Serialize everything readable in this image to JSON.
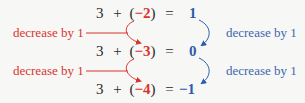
{
  "equations": [
    {
      "lhs_a": "3",
      "op": "+",
      "open": "(",
      "neg": "−2",
      "close": ")",
      "eq": "=",
      "result": "1"
    },
    {
      "lhs_a": "3",
      "op": "+",
      "open": "(",
      "neg": "−3",
      "close": ")",
      "eq": "=",
      "result": "0"
    },
    {
      "lhs_a": "3",
      "op": "+",
      "open": "(",
      "neg": "−4",
      "close": ")",
      "eq": "=",
      "result": "−1"
    }
  ],
  "left_labels": [
    "decrease by 1",
    "decrease by 1"
  ],
  "right_labels": [
    "decrease by 1",
    "decrease by 1"
  ],
  "colors": {
    "addend_accent": "#d9342f",
    "result_accent": "#2d5cad",
    "text": "#2a2a2a",
    "background": "#f7f7f5"
  }
}
